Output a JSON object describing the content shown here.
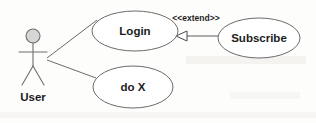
{
  "diagram": {
    "type": "uml-use-case-diagram",
    "background_color": "#fdfdfc",
    "stroke_color": "#6b6b6b",
    "text_color": "#1c1c1c",
    "actor_head_fill": "#d6d6d6",
    "actors": [
      {
        "id": "user",
        "label": "User",
        "shape": "stick-figure",
        "cx": 33,
        "head_cy": 36,
        "head_r": 7,
        "label_x": 33,
        "label_y": 101
      }
    ],
    "use_cases": [
      {
        "id": "login",
        "label": "Login",
        "shape": "ellipse",
        "cx": 135,
        "cy": 31,
        "rx": 43,
        "ry": 20
      },
      {
        "id": "do-x",
        "label": "do X",
        "shape": "ellipse",
        "cx": 133,
        "cy": 87,
        "rx": 40,
        "ry": 21
      },
      {
        "id": "subscribe",
        "label": "Subscribe",
        "shape": "ellipse",
        "cx": 259,
        "cy": 38,
        "rx": 41,
        "ry": 20
      }
    ],
    "associations": [
      {
        "id": "user-login",
        "from": "user",
        "to": "login",
        "style": "solid"
      },
      {
        "id": "user-do-x",
        "from": "user",
        "to": "do-x",
        "style": "solid"
      }
    ],
    "relationships": [
      {
        "id": "subscribe-extends-login",
        "from": "subscribe",
        "to": "login",
        "stereotype": "<<extend>>",
        "arrow": "open-triangle",
        "line": "solid",
        "label_x": 196,
        "label_y": 21
      }
    ]
  }
}
